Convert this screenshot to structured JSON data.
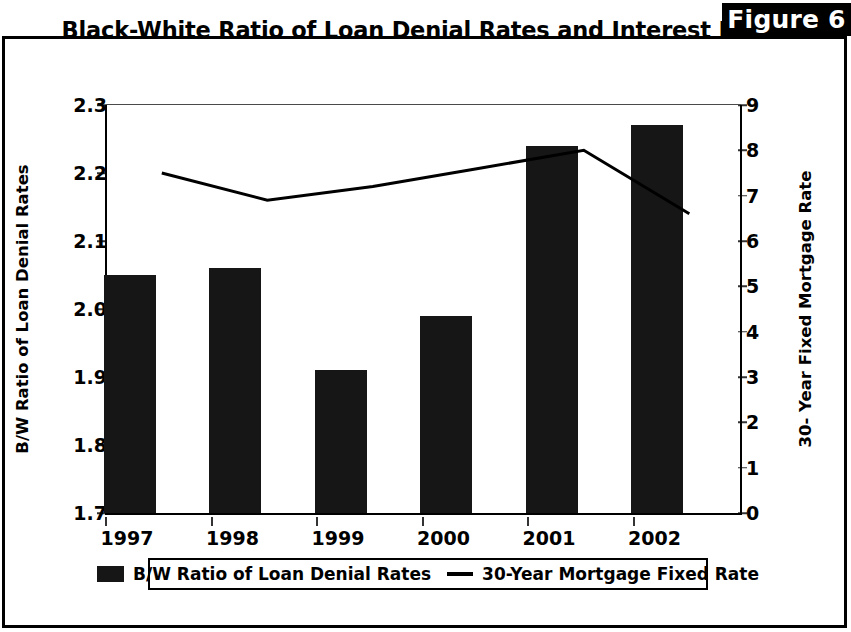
{
  "figure": {
    "tag": "Figure 6"
  },
  "chart_data": {
    "type": "bar",
    "title": "Black-White Ratio of Loan Denial Rates and Interest Rates",
    "categories": [
      "1997",
      "1998",
      "1999",
      "2000",
      "2001",
      "2002"
    ],
    "xlabel": "",
    "ylabel": "B/W Ratio of Loan Denial Rates",
    "ylabel_right": "30- Year Fixed Mortgage Rate",
    "ylim": [
      1.7,
      2.3
    ],
    "ylim_right": [
      0,
      9
    ],
    "yticks": [
      "2.3",
      "2.2",
      "2.1",
      "2.0",
      "1.9",
      "1.8",
      "1.7"
    ],
    "ytick_values": [
      2.3,
      2.2,
      2.1,
      2.0,
      1.9,
      1.8,
      1.7
    ],
    "yticks_right": [
      "9",
      "8",
      "7",
      "6",
      "5",
      "4",
      "3",
      "2",
      "1",
      "0"
    ],
    "ytick_values_right": [
      9,
      8,
      7,
      6,
      5,
      4,
      3,
      2,
      1,
      0
    ],
    "grid": false,
    "legend_position": "bottom",
    "series": [
      {
        "name": "B/W Ratio of Loan Denial Rates",
        "type": "bar",
        "axis": "left",
        "color": "#161616",
        "values": [
          2.05,
          2.06,
          1.91,
          1.99,
          2.24,
          2.27
        ]
      },
      {
        "name": "30-Year Mortgage Fixed Rate",
        "type": "line",
        "axis": "right",
        "color": "#000000",
        "values": [
          7.5,
          6.9,
          7.2,
          7.6,
          8.0,
          6.6
        ]
      }
    ]
  },
  "legend": {
    "bar_label": "B/W Ratio of Loan Denial Rates",
    "line_label": "30-Year Mortgage Fixed Rate"
  }
}
